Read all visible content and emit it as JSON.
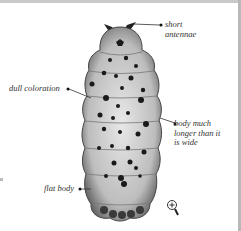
{
  "figure": {
    "labels": [
      {
        "id": "antennae",
        "text": "short\nantennae"
      },
      {
        "id": "coloration",
        "text": "dull coloration"
      },
      {
        "id": "length",
        "text": "body much\nlonger than it\nis wide"
      },
      {
        "id": "flat",
        "text": "flat body"
      }
    ],
    "zoom_icon": "magnifier-plus-icon"
  }
}
